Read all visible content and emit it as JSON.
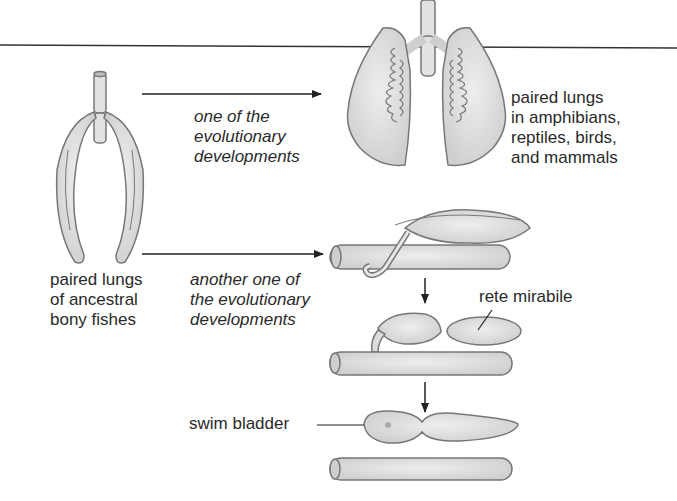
{
  "diagram": {
    "colors": {
      "fill": "#e0e0e0",
      "stroke": "#777777",
      "line": "#222222",
      "background": "#ffffff"
    },
    "labels": {
      "ancestral_lungs": "paired lungs\nof ancestral\nbony fishes",
      "path_one": "one of the\nevolutionary\ndevelopments",
      "tetrapod_lungs": "paired lungs\nin amphibians,\nreptiles, birds,\nand mammals",
      "path_two": "another one of\nthe evolutionary\ndevelopments",
      "rete_mirabile": "rete mirabile",
      "swim_bladder": "swim bladder"
    },
    "nodes": [
      {
        "id": "ancestral_lungs",
        "label": "paired lungs of ancestral bony fishes"
      },
      {
        "id": "tetrapod_lungs",
        "label": "paired lungs in amphibians, reptiles, birds, and mammals"
      },
      {
        "id": "swim_bladder_stage1",
        "label": ""
      },
      {
        "id": "swim_bladder_stage2",
        "label": "rete mirabile"
      },
      {
        "id": "swim_bladder_stage3",
        "label": "swim bladder"
      }
    ],
    "edges": [
      {
        "from": "ancestral_lungs",
        "to": "tetrapod_lungs",
        "label": "one of the evolutionary developments"
      },
      {
        "from": "ancestral_lungs",
        "to": "swim_bladder_stage1",
        "label": "another one of the evolutionary developments"
      },
      {
        "from": "swim_bladder_stage1",
        "to": "swim_bladder_stage2",
        "label": ""
      },
      {
        "from": "swim_bladder_stage2",
        "to": "swim_bladder_stage3",
        "label": ""
      }
    ]
  }
}
